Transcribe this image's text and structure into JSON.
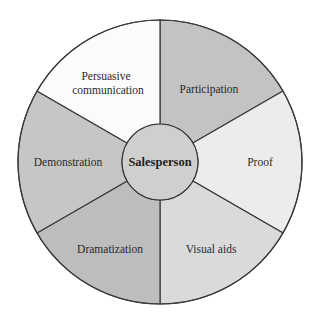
{
  "diagram": {
    "type": "wheel",
    "center": {
      "label": "Salesperson",
      "fill": "#cfcfcf"
    },
    "stroke": "#3a3a3a",
    "segments": [
      {
        "id": "participation",
        "label": "Participation",
        "fill": "#c3c3c3"
      },
      {
        "id": "proof",
        "label": "Proof",
        "fill": "#ececec"
      },
      {
        "id": "visual-aids",
        "label": "Visual aids",
        "fill": "#dadada"
      },
      {
        "id": "dramatization",
        "label": "Dramatization",
        "fill": "#bdbdbd"
      },
      {
        "id": "demonstration",
        "label": "Demonstration",
        "fill": "#c6c6c6"
      },
      {
        "id": "persuasive-communication",
        "label_line1": "Persuasive",
        "label_line2": "communication",
        "fill": "#fbfbfb"
      }
    ]
  }
}
